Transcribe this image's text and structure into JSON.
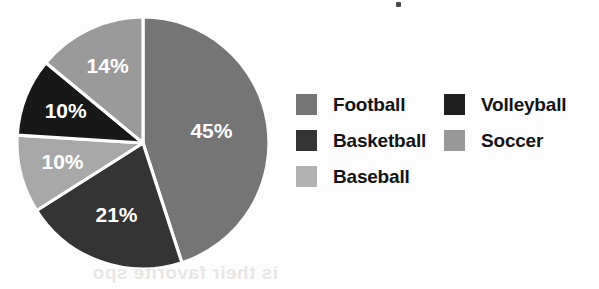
{
  "chart_data": {
    "type": "pie",
    "title": "",
    "xlabel": "",
    "ylabel": "",
    "legend_position": "right",
    "grid": false,
    "start_angle_deg": 0,
    "direction": "clockwise",
    "categories": [
      "Football",
      "Basketball",
      "Baseball",
      "Volleyball",
      "Soccer"
    ],
    "values": [
      45,
      21,
      10,
      10,
      14
    ],
    "value_suffix": "%",
    "slices": [
      {
        "label": "Football",
        "value": 45,
        "display": "45%",
        "color": "#757575",
        "start_angle_deg": 0,
        "end_angle_deg": 162,
        "label_color": "#ffffff"
      },
      {
        "label": "Basketball",
        "value": 21,
        "display": "21%",
        "color": "#343434",
        "start_angle_deg": 162,
        "end_angle_deg": 237.6,
        "label_color": "#ffffff"
      },
      {
        "label": "Baseball",
        "value": 10,
        "display": "10%",
        "color": "#a8a8a8",
        "start_angle_deg": 237.6,
        "end_angle_deg": 273.6,
        "label_color": "#ffffff"
      },
      {
        "label": "Volleyball",
        "value": 10,
        "display": "10%",
        "color": "#181818",
        "start_angle_deg": 273.6,
        "end_angle_deg": 309.6,
        "label_color": "#ffffff"
      },
      {
        "label": "Soccer",
        "value": 14,
        "display": "14%",
        "color": "#9a9a9a",
        "start_angle_deg": 309.6,
        "end_angle_deg": 360,
        "label_color": "#ffffff"
      }
    ],
    "separator_color": "#fdfdfd"
  },
  "legend": {
    "columns": [
      {
        "items": [
          {
            "label": "Football",
            "color": "#757575"
          },
          {
            "label": "Basketball",
            "color": "#343434"
          },
          {
            "label": "Baseball",
            "color": "#b2b2b2"
          }
        ]
      },
      {
        "items": [
          {
            "label": "Volleyball",
            "color": "#1f1f1f"
          },
          {
            "label": "Soccer",
            "color": "#989898"
          }
        ]
      }
    ]
  },
  "artifacts": {
    "bleed_through_text": "is their favorite spo"
  }
}
